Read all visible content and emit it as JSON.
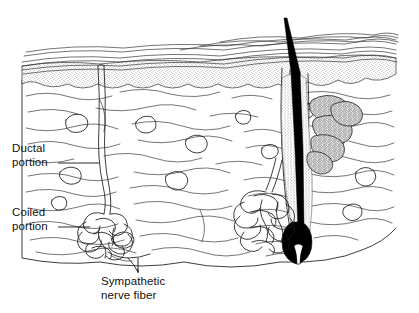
{
  "figure": {
    "background_color": "#ffffff",
    "ink_color": "#1a1a1a",
    "hair_color": "#000000",
    "width": 419,
    "height": 313
  },
  "labels": {
    "ductal": {
      "line1": "Ductal",
      "line2": "portion"
    },
    "coiled": {
      "line1": "Coiled",
      "line2": "portion"
    },
    "nerve": {
      "line1": "Sympathetic",
      "line2": "nerve fiber"
    }
  },
  "structures": [
    {
      "name": "epidermis",
      "description": "stippled surface layer"
    },
    {
      "name": "stratum-corneum",
      "description": "wavy horizontal surface lines"
    },
    {
      "name": "dermis",
      "description": "wavy collagen fiber field"
    },
    {
      "name": "eccrine-duct",
      "description": "ductal portion of sweat gland"
    },
    {
      "name": "eccrine-coil",
      "description": "coiled secretory portion"
    },
    {
      "name": "sympathetic-nerve-fiber",
      "description": "nerve to gland"
    },
    {
      "name": "hair-shaft",
      "description": "black hair emerging from follicle"
    },
    {
      "name": "hair-follicle",
      "description": "follicle with bulb and papilla"
    },
    {
      "name": "sebaceous-gland",
      "description": "lobed oil gland"
    },
    {
      "name": "apocrine-gland",
      "description": "coiled gland beside follicle"
    }
  ]
}
